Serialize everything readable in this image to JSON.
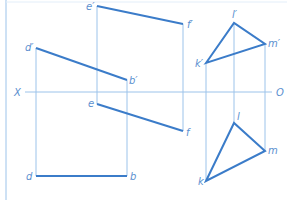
{
  "colors": {
    "line": "#9cc3ea",
    "edge": "#3b7cc9",
    "label": "#5b8fcf"
  },
  "axis": {
    "left_label": "X",
    "right_label": "O"
  },
  "labels": {
    "d_prime": "d′",
    "b_prime": "b′",
    "e_prime": "e′",
    "f_prime": "f′",
    "d": "d",
    "b": "b",
    "e": "e",
    "f": "f",
    "k_prime": "k′",
    "l_prime": "l′",
    "m_prime": "m′",
    "k": "k",
    "l": "l",
    "m": "m"
  }
}
